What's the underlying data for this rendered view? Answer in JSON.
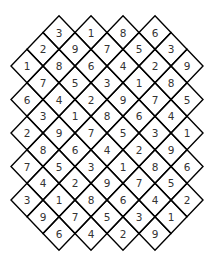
{
  "puzzle": {
    "type": "diamond-number-grid",
    "line_color": "#000000",
    "digit_color": "#333333",
    "background": "#ffffff",
    "rows": [
      [
        3,
        1,
        8,
        6
      ],
      [
        2,
        9,
        7,
        5,
        3
      ],
      [
        1,
        8,
        6,
        4,
        2,
        9
      ],
      [
        7,
        5,
        3,
        1,
        8
      ],
      [
        6,
        4,
        2,
        9,
        7,
        5
      ],
      [
        3,
        1,
        8,
        6,
        4
      ],
      [
        2,
        9,
        7,
        5,
        3,
        1
      ],
      [
        8,
        6,
        4,
        2,
        9
      ],
      [
        7,
        5,
        3,
        1,
        8,
        6
      ],
      [
        4,
        2,
        9,
        7,
        5
      ],
      [
        3,
        1,
        8,
        6,
        4,
        2
      ],
      [
        9,
        7,
        5,
        3,
        1
      ],
      [
        6,
        4,
        2,
        9
      ]
    ]
  }
}
